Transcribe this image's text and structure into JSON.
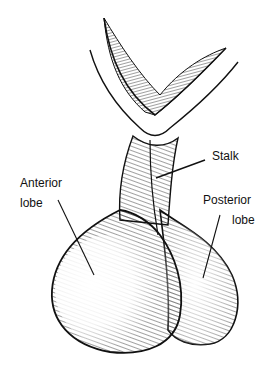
{
  "diagram": {
    "labels": {
      "anterior_line1": "Anterior",
      "anterior_line2": "lobe",
      "stalk": "Stalk",
      "posterior_line1": "Posterior",
      "posterior_line2": "lobe"
    },
    "colors": {
      "ink": "#111111",
      "background": "#ffffff"
    }
  }
}
